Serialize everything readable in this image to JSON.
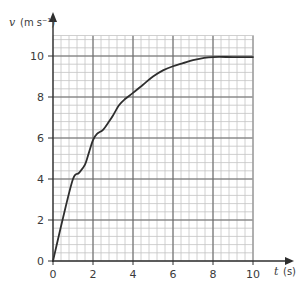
{
  "chart_data": {
    "type": "line",
    "title": "",
    "xlabel": "t",
    "xlabel_unit": "(s)",
    "ylabel": "v",
    "ylabel_unit": "(m s⁻¹)",
    "xlim": [
      0,
      10
    ],
    "ylim": [
      0,
      11
    ],
    "x_ticks": [
      0,
      2,
      4,
      6,
      8,
      10
    ],
    "y_ticks": [
      0,
      2,
      4,
      6,
      8,
      10
    ],
    "x_tick_labels": [
      "0",
      "2",
      "4",
      "6",
      "8",
      "10"
    ],
    "y_tick_labels": [
      "0",
      "2",
      "4",
      "6",
      "8",
      "10"
    ],
    "grid": true,
    "minor_grid_step": 0.4,
    "legend": "none",
    "series": [
      {
        "name": "velocity",
        "x": [
          0,
          0.5,
          1,
          1.3,
          1.6,
          1.8,
          2,
          2.2,
          2.5,
          2.8,
          3,
          3.3,
          3.6,
          4,
          4.5,
          5,
          5.5,
          6,
          6.5,
          7,
          7.5,
          8,
          9,
          10
        ],
        "y": [
          0,
          2.1,
          4,
          4.3,
          4.7,
          5.3,
          5.9,
          6.2,
          6.4,
          6.8,
          7.1,
          7.6,
          7.9,
          8.2,
          8.6,
          9,
          9.3,
          9.5,
          9.65,
          9.8,
          9.9,
          9.95,
          9.95,
          9.95
        ]
      }
    ],
    "colors": {
      "curve": "#2e2e2e",
      "axis": "#2e2e2e",
      "major_grid": "#6a6a6a",
      "minor_grid": "#c4c4c4"
    }
  }
}
